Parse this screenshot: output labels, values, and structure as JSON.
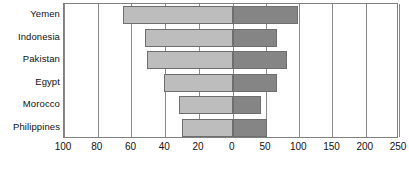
{
  "chart_data": {
    "type": "bar",
    "subtype": "diverging-horizontal-tornado",
    "title": "",
    "xlabel": "",
    "ylabel": "",
    "grid": true,
    "legend": "none",
    "categories": [
      "Yemen",
      "Indonesia",
      "Pakistan",
      "Egypt",
      "Morocco",
      "Philippines"
    ],
    "series": [
      {
        "name": "left",
        "side": "left",
        "color": "#bdbdbd",
        "axis_label": "",
        "axis_range": [
          0,
          100
        ],
        "axis_direction": "reversed",
        "axis_ticks": [
          100,
          80,
          60,
          40,
          20,
          0
        ],
        "values": [
          65,
          52,
          51,
          41,
          32,
          30
        ]
      },
      {
        "name": "right",
        "side": "right",
        "color": "#858585",
        "axis_label": "",
        "axis_range": [
          0,
          250
        ],
        "axis_direction": "normal",
        "axis_ticks": [
          0,
          50,
          100,
          150,
          200,
          250
        ],
        "values": [
          98,
          67,
          82,
          67,
          43,
          52
        ]
      }
    ],
    "axis_tick_labels": [
      "100",
      "80",
      "60",
      "40",
      "20",
      "0",
      "50",
      "100",
      "150",
      "200",
      "250"
    ]
  },
  "colors": {
    "left_bar": "#bdbdbd",
    "right_bar": "#858585",
    "bar_border": "#6e6e6e",
    "gridline": "#8a8a8a",
    "plot_border": "#808080",
    "background": "#ffffff",
    "text": "#111111"
  }
}
